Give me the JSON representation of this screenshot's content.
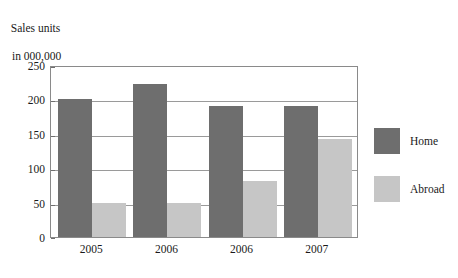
{
  "chart_data": {
    "type": "bar",
    "title": "",
    "ylabel_lines": [
      "Sales units",
      "in 000,000"
    ],
    "xlabel": "",
    "categories": [
      "2005",
      "2006",
      "2006",
      "2007"
    ],
    "series": [
      {
        "name": "Home",
        "color": "#6e6e6e",
        "values": [
          200,
          223,
          190,
          190
        ]
      },
      {
        "name": "Abroad",
        "color": "#c6c6c6",
        "values": [
          50,
          50,
          82,
          142
        ]
      }
    ],
    "ylim": [
      0,
      250
    ],
    "yticks": [
      0,
      50,
      100,
      150,
      200,
      250
    ],
    "grid": true,
    "legend_position": "right"
  },
  "legend": {
    "entries": [
      {
        "label": "Home",
        "swatch": "home"
      },
      {
        "label": "Abroad",
        "swatch": "abroad"
      }
    ]
  }
}
